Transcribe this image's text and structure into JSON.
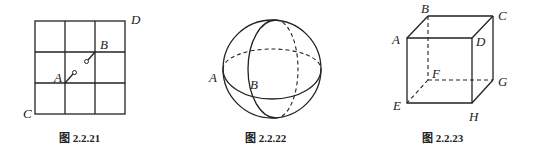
{
  "figures": [
    {
      "caption": "图 2.2.21",
      "type": "grid",
      "labels": {
        "A": "A",
        "B": "B",
        "C": "C",
        "D": "D"
      }
    },
    {
      "caption": "图 2.2.22",
      "type": "sphere",
      "labels": {
        "A": "A",
        "B": "B"
      }
    },
    {
      "caption": "图 2.2.23",
      "type": "cube",
      "labels": {
        "A": "A",
        "B": "B",
        "C": "C",
        "D": "D",
        "E": "E",
        "F": "F",
        "G": "G",
        "H": "H"
      }
    }
  ]
}
